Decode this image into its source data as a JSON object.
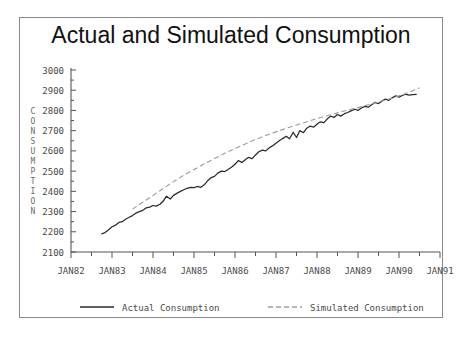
{
  "chart_data": {
    "type": "line",
    "title": "Actual and Simulated Consumption",
    "xlabel": "",
    "ylabel": "CONSUMPTION",
    "ylim": [
      2100,
      3000
    ],
    "ytick_labels": [
      "3000",
      "2900",
      "2800",
      "2700",
      "2600",
      "2500",
      "2400",
      "2300",
      "2200",
      "2100"
    ],
    "ytick_values": [
      3000,
      2900,
      2800,
      2700,
      2600,
      2500,
      2400,
      2300,
      2200,
      2100
    ],
    "xtick_labels": [
      "JAN82",
      "JAN83",
      "JAN84",
      "JAN85",
      "JAN86",
      "JAN87",
      "JAN88",
      "JAN89",
      "JAN90",
      "JAN91"
    ],
    "xtick_values": [
      1982.0,
      1983.0,
      1984.0,
      1985.0,
      1986.0,
      1987.0,
      1988.0,
      1989.0,
      1990.0,
      1991.0
    ],
    "minor_ticks": "half-year",
    "xlim": [
      1982.0,
      1991.0
    ],
    "grid": false,
    "legend_position": "below-axes",
    "series": [
      {
        "name": "Actual Consumption",
        "style": "solid",
        "color": "#2b2b2b",
        "x": [
          1982.75,
          1982.83,
          1982.92,
          1983.0,
          1983.08,
          1983.17,
          1983.25,
          1983.33,
          1983.42,
          1983.5,
          1983.58,
          1983.67,
          1983.75,
          1983.83,
          1983.92,
          1984.0,
          1984.08,
          1984.17,
          1984.25,
          1984.33,
          1984.42,
          1984.5,
          1984.58,
          1984.67,
          1984.75,
          1984.83,
          1984.92,
          1985.0,
          1985.08,
          1985.17,
          1985.25,
          1985.33,
          1985.42,
          1985.5,
          1985.58,
          1985.67,
          1985.75,
          1985.83,
          1985.92,
          1986.0,
          1986.08,
          1986.17,
          1986.25,
          1986.33,
          1986.42,
          1986.5,
          1986.58,
          1986.67,
          1986.75,
          1986.83,
          1986.92,
          1987.0,
          1987.08,
          1987.17,
          1987.25,
          1987.33,
          1987.42,
          1987.5,
          1987.58,
          1987.67,
          1987.75,
          1987.83,
          1987.92,
          1988.0,
          1988.08,
          1988.17,
          1988.25,
          1988.33,
          1988.42,
          1988.5,
          1988.58,
          1988.67,
          1988.75,
          1988.83,
          1988.92,
          1989.0,
          1989.08,
          1989.17,
          1989.25,
          1989.33,
          1989.42,
          1989.5,
          1989.58,
          1989.67,
          1989.75,
          1989.83,
          1989.92,
          1990.0,
          1990.08,
          1990.17,
          1990.25,
          1990.33,
          1990.42
        ],
        "y": [
          2190,
          2196,
          2210,
          2225,
          2232,
          2246,
          2250,
          2262,
          2272,
          2280,
          2292,
          2300,
          2306,
          2318,
          2322,
          2330,
          2327,
          2336,
          2352,
          2376,
          2362,
          2380,
          2390,
          2400,
          2408,
          2415,
          2420,
          2418,
          2424,
          2420,
          2432,
          2452,
          2468,
          2474,
          2490,
          2500,
          2498,
          2508,
          2520,
          2534,
          2552,
          2543,
          2556,
          2568,
          2562,
          2580,
          2596,
          2604,
          2600,
          2614,
          2626,
          2638,
          2650,
          2662,
          2672,
          2660,
          2692,
          2666,
          2700,
          2690,
          2712,
          2722,
          2718,
          2732,
          2744,
          2740,
          2758,
          2772,
          2766,
          2780,
          2772,
          2784,
          2790,
          2798,
          2806,
          2800,
          2812,
          2820,
          2816,
          2828,
          2840,
          2834,
          2846,
          2856,
          2850,
          2862,
          2872,
          2866,
          2874,
          2880,
          2876,
          2878,
          2880
        ]
      },
      {
        "name": "Simulated Consumption",
        "style": "dashed",
        "color": "#9a9a9a",
        "x": [
          1983.5,
          1983.75,
          1984.0,
          1984.25,
          1984.5,
          1984.75,
          1985.0,
          1985.25,
          1985.5,
          1985.75,
          1986.0,
          1986.25,
          1986.5,
          1986.75,
          1987.0,
          1987.25,
          1987.5,
          1987.75,
          1988.0,
          1988.25,
          1988.5,
          1988.75,
          1989.0,
          1989.25,
          1989.5,
          1989.75,
          1990.0,
          1990.25,
          1990.5
        ],
        "y": [
          2312,
          2346,
          2380,
          2414,
          2448,
          2480,
          2508,
          2536,
          2562,
          2588,
          2612,
          2634,
          2656,
          2676,
          2694,
          2712,
          2728,
          2744,
          2760,
          2774,
          2788,
          2802,
          2814,
          2828,
          2842,
          2856,
          2872,
          2890,
          2912
        ]
      }
    ]
  },
  "legend": {
    "entries": [
      {
        "label": "Actual Consumption",
        "style": "solid"
      },
      {
        "label": "Simulated Consumption",
        "style": "dashed"
      }
    ]
  }
}
